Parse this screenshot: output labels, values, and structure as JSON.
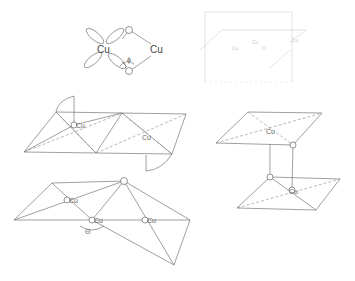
{
  "diagram": {
    "type": "crystal-structure-sketches",
    "panels": [
      {
        "name": "carboxylate-bridge",
        "labels": {
          "cu_left": "Cu",
          "cu_right": "Cu",
          "o_top": "O",
          "o_bottom": "O",
          "phi": "ϕ"
        }
      },
      {
        "name": "faint-projection-box",
        "labels": {
          "cu1": "Cu",
          "cu2": "Cu",
          "o": "O",
          "mark": "Cu"
        }
      },
      {
        "name": "edge-sharing-octahedra",
        "labels": {
          "cu1": "Cu",
          "cu2": "Cu"
        }
      },
      {
        "name": "stacked-square-planes",
        "labels": {
          "cu_top": "Cu",
          "cu_bottom": "Cu"
        }
      },
      {
        "name": "corner-sharing-triangles",
        "labels": {
          "cu1": "Cu",
          "cu2": "Cu",
          "cu3": "Cu",
          "theta": "Θ"
        }
      }
    ]
  }
}
